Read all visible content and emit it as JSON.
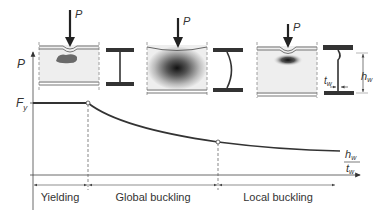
{
  "diagram": {
    "type": "web crippling / concentrated load resistance vs web slenderness",
    "load_label": "P",
    "axes": {
      "y_label": "P",
      "y_level_label_main": "F",
      "y_level_label_sub": "y",
      "x_label_num_main": "h",
      "x_label_num_sub": "w",
      "x_label_den_main": "t",
      "x_label_den_sub": "w"
    },
    "regions": [
      {
        "label": "Yielding"
      },
      {
        "label": "Global buckling"
      },
      {
        "label": "Local buckling"
      }
    ],
    "section_dims": {
      "web_thickness_main": "t",
      "web_thickness_sub": "w",
      "web_height_main": "h",
      "web_height_sub": "w"
    },
    "panels": [
      {
        "name": "yielding",
        "load": "P"
      },
      {
        "name": "global-buckling",
        "load": "P"
      },
      {
        "name": "local-buckling",
        "load": "P"
      }
    ],
    "colors": {
      "line": "#3a3a3a",
      "panel_fill": "#eeeeee",
      "dark": "#333333"
    }
  }
}
